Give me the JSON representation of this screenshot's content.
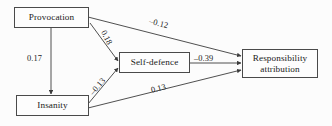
{
  "diagram": {
    "type": "path-diagram",
    "background_color": "#fcfcfc",
    "box_border_color": "#4a4a4a",
    "line_color": "#3c3c3c",
    "nodes": [
      {
        "id": "provocation",
        "label": "Provocation"
      },
      {
        "id": "insanity",
        "label": "Insanity"
      },
      {
        "id": "self_defence",
        "label": "Self-defence"
      },
      {
        "id": "responsibility",
        "label": "Responsibility\nattribution"
      }
    ],
    "responsibility_line1": "Responsibility",
    "responsibility_line2": "attribution",
    "edges": [
      {
        "id": "prov_to_resp",
        "from": "provocation",
        "to": "responsibility",
        "coefficient": "–0.12"
      },
      {
        "id": "prov_to_self",
        "from": "provocation",
        "to": "self_defence",
        "coefficient": "0.18"
      },
      {
        "id": "prov_to_insanity",
        "from": "provocation",
        "to": "insanity",
        "coefficient": "0.17"
      },
      {
        "id": "insanity_to_self",
        "from": "insanity",
        "to": "self_defence",
        "coefficient": "–0.13"
      },
      {
        "id": "self_to_resp",
        "from": "self_defence",
        "to": "responsibility",
        "coefficient": "–0.39"
      },
      {
        "id": "insanity_to_resp",
        "from": "insanity",
        "to": "responsibility",
        "coefficient": "0.13"
      }
    ]
  }
}
